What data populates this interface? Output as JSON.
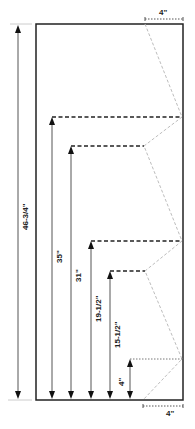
{
  "diagram": {
    "title_fragment": "· · ·",
    "colors": {
      "outline": "#222222",
      "dim_line": "#555555",
      "dashed_guide": "#222222",
      "zigzag": "#bdbdbd",
      "reference": "#cccccc"
    },
    "overall_height": {
      "label": "46-3/4\""
    },
    "top_offset": {
      "label": "4\""
    },
    "bottom_offset": {
      "label": "4\""
    },
    "measurements": [
      {
        "label": "35\""
      },
      {
        "label": "31\""
      },
      {
        "label": "19-1/2\""
      },
      {
        "label": "15-1/2\""
      },
      {
        "label": "4\""
      }
    ]
  }
}
